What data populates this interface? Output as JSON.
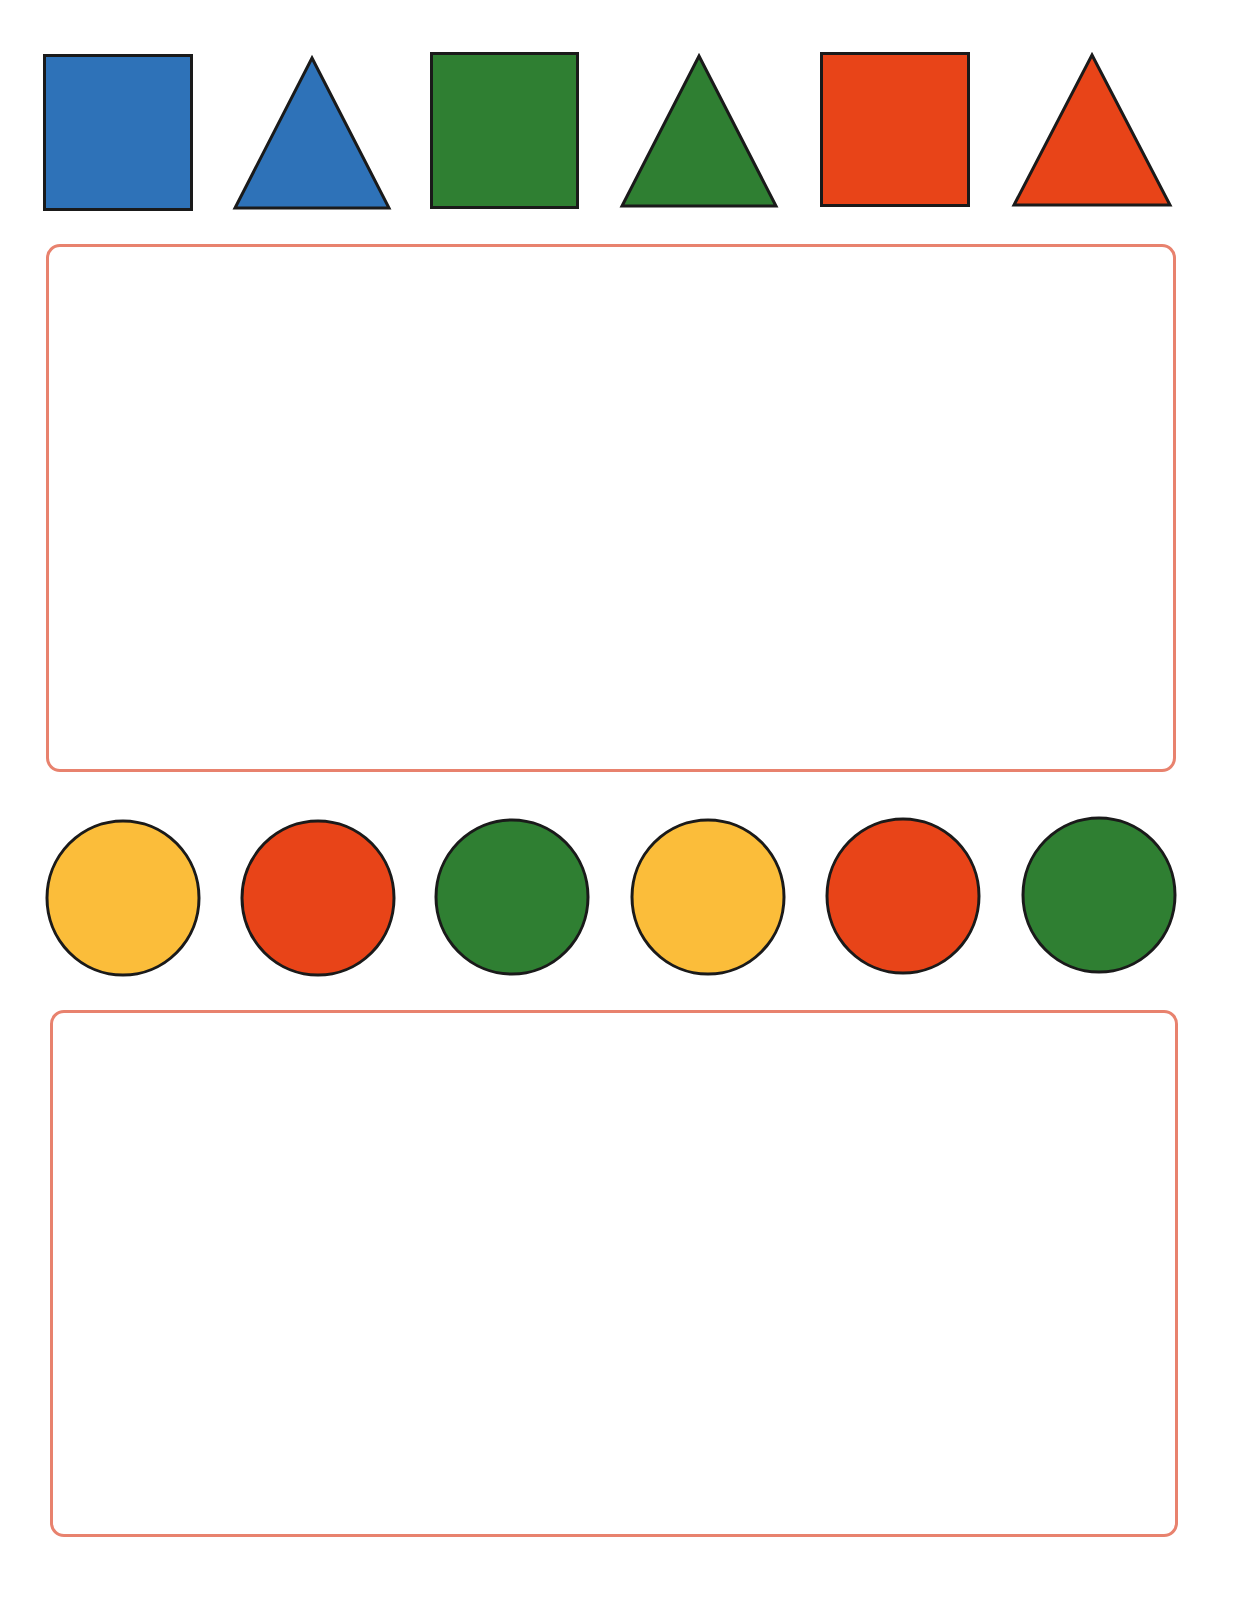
{
  "worksheet": {
    "colors": {
      "blue": "#2e72b8",
      "green": "#2f7f32",
      "red": "#e84418",
      "yellow": "#fbbd3a",
      "outline": "#1a1a1a",
      "box_border": "#e8826e"
    },
    "pattern_row_1": [
      {
        "shape": "square",
        "color": "blue"
      },
      {
        "shape": "triangle",
        "color": "blue"
      },
      {
        "shape": "square",
        "color": "green"
      },
      {
        "shape": "triangle",
        "color": "green"
      },
      {
        "shape": "square",
        "color": "red"
      },
      {
        "shape": "triangle",
        "color": "red"
      }
    ],
    "answer_box_1": {
      "content": ""
    },
    "pattern_row_2": [
      {
        "shape": "circle",
        "color": "yellow"
      },
      {
        "shape": "circle",
        "color": "red"
      },
      {
        "shape": "circle",
        "color": "green"
      },
      {
        "shape": "circle",
        "color": "yellow"
      },
      {
        "shape": "circle",
        "color": "red"
      },
      {
        "shape": "circle",
        "color": "green"
      }
    ],
    "answer_box_2": {
      "content": ""
    }
  }
}
